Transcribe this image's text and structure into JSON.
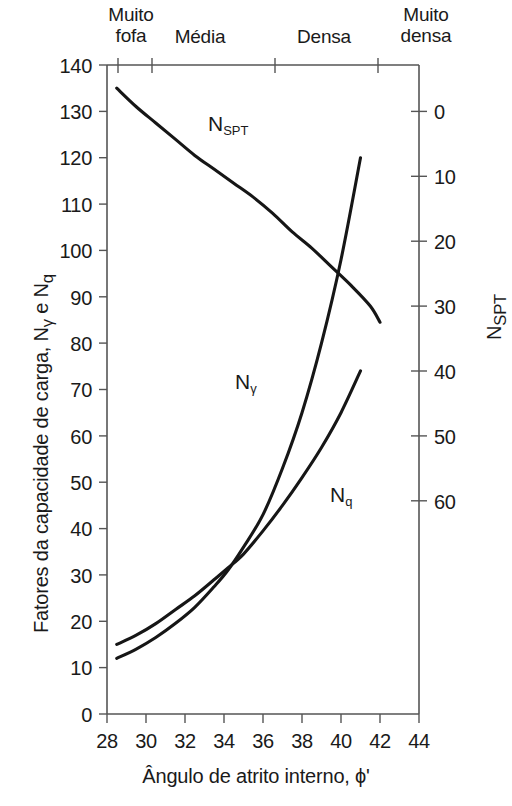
{
  "chart_data": {
    "type": "line",
    "title": "",
    "xlabel": "Ângulo de atrito interno, ϕ'",
    "ylabel": "Fatores da capacidade de carga, Nγ e Nq",
    "ylabel_right": "NSPT",
    "xlim": [
      28,
      44
    ],
    "ylim": [
      0,
      140
    ],
    "ylim_right": [
      0,
      70
    ],
    "right_axis_inverted": true,
    "xticks": [
      28,
      30,
      32,
      34,
      36,
      38,
      40,
      42,
      44
    ],
    "yticks": [
      0,
      10,
      20,
      30,
      40,
      50,
      60,
      70,
      80,
      90,
      100,
      110,
      120,
      130,
      140
    ],
    "yticks_right": [
      0,
      10,
      20,
      30,
      40,
      50,
      60
    ],
    "grid": false,
    "legend": "inline-annotations",
    "zone_labels": [
      "Muito fofa",
      "Média",
      "Densa",
      "Muito densa"
    ],
    "zone_boundaries": [
      28.5,
      30.0,
      36.0,
      41.0
    ],
    "series": [
      {
        "name": "NSPT",
        "axis": "right",
        "x": [
          28.5,
          29.5,
          30.5,
          31.5,
          32.5,
          33.5,
          34.5,
          35.5,
          36.5,
          37.5,
          38.5,
          39.5,
          40.5,
          41.5,
          42.0
        ],
        "values": [
          135,
          131,
          127.5,
          124,
          120.5,
          117.5,
          114.5,
          111.5,
          108,
          104,
          100.5,
          96.5,
          92.5,
          88,
          84.5
        ]
      },
      {
        "name": "Nγ",
        "axis": "left",
        "x": [
          28.5,
          29.5,
          30.5,
          31.5,
          32.5,
          33.5,
          34.2,
          35.0,
          36.0,
          37.0,
          38.0,
          39.0,
          40.0,
          41.0
        ],
        "values": [
          12,
          14,
          16.5,
          19.5,
          23,
          27.5,
          31,
          36,
          43,
          53,
          65,
          80,
          98,
          120
        ]
      },
      {
        "name": "Nq",
        "axis": "left",
        "x": [
          28.5,
          29.5,
          30.5,
          31.5,
          32.5,
          33.5,
          34.2,
          35.0,
          36.0,
          37.0,
          38.0,
          39.0,
          40.0,
          41.0
        ],
        "values": [
          15,
          17,
          19.5,
          22.5,
          25.5,
          29,
          31.5,
          34.5,
          39.5,
          45,
          51,
          57.5,
          65,
          74
        ]
      }
    ]
  },
  "axes": {
    "left_title": "Fatores da capacidade de carga, N",
    "left_title_sub1": "γ",
    "left_title_mid": " e N",
    "left_title_sub2": "q",
    "right_title": "N",
    "right_title_sub": "SPT",
    "bottom_title": "Ângulo de atrito interno, ϕ'"
  },
  "annotations": {
    "nspt": {
      "base": "N",
      "sub": "SPT"
    },
    "ngamma": {
      "base": "N",
      "sub": "γ"
    },
    "nq": {
      "base": "N",
      "sub": "q"
    }
  },
  "zones": [
    {
      "label": "Muito\nfofa"
    },
    {
      "label": "Média"
    },
    {
      "label": "Densa"
    },
    {
      "label": "Muito\ndensa"
    }
  ],
  "colors": {
    "ink": "#1a1a1a",
    "axis": "#555555",
    "curve": "#161616",
    "background": "#ffffff"
  }
}
